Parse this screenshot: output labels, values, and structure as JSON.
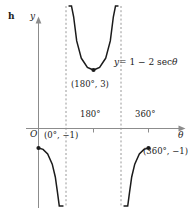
{
  "figure": {
    "part_label": "h"
  },
  "chart_data": {
    "type": "line",
    "title": "",
    "equation_label": "y = 1 − 2 sec θ",
    "equation_parts": {
      "lhs": "y",
      "rhs": "= 1 − 2 sec",
      "variable": "θ"
    },
    "xlabel": "θ",
    "ylabel": "y",
    "origin_label": "O",
    "xlim": [
      -20,
      395
    ],
    "ylim": [
      -11,
      11
    ],
    "grid": false,
    "legend": "none",
    "xticks": [
      180,
      360
    ],
    "xtick_labels": [
      "180°",
      "360°"
    ],
    "yticks": [],
    "ytick_labels": [],
    "asymptotes": [
      {
        "x": 90,
        "style": "dashed"
      },
      {
        "x": 270,
        "style": "dashed"
      }
    ],
    "points": [
      {
        "x": 0,
        "y": -1,
        "label": "(0°, −1)"
      },
      {
        "x": 180,
        "y": 3,
        "label": "(180°, 3)"
      },
      {
        "x": 360,
        "y": -1,
        "label": "(360°, −1)"
      }
    ],
    "series": [
      {
        "name": "y = 1 - 2 sec(theta) branch 1",
        "x_range": [
          0,
          90
        ],
        "values": [
          {
            "x": 0,
            "y": -1
          },
          {
            "x": 15,
            "y": -1.071
          },
          {
            "x": 30,
            "y": -1.309
          },
          {
            "x": 45,
            "y": -1.828
          },
          {
            "x": 55,
            "y": -2.487
          },
          {
            "x": 62,
            "y": -3.26
          },
          {
            "x": 68,
            "y": -4.34
          },
          {
            "x": 72,
            "y": -5.47
          },
          {
            "x": 75,
            "y": -6.73
          },
          {
            "x": 78,
            "y": -8.62
          },
          {
            "x": 80,
            "y": -10.52
          }
        ]
      },
      {
        "name": "y = 1 - 2 sec(theta) branch 2",
        "x_range": [
          90,
          270
        ],
        "values": [
          {
            "x": 100,
            "y": 12.51
          },
          {
            "x": 103,
            "y": 9.88
          },
          {
            "x": 108,
            "y": 7.47
          },
          {
            "x": 115,
            "y": 5.73
          },
          {
            "x": 125,
            "y": 4.49
          },
          {
            "x": 140,
            "y": 3.61
          },
          {
            "x": 160,
            "y": 3.13
          },
          {
            "x": 180,
            "y": 3.0
          },
          {
            "x": 200,
            "y": 3.13
          },
          {
            "x": 220,
            "y": 3.61
          },
          {
            "x": 235,
            "y": 4.49
          },
          {
            "x": 245,
            "y": 5.73
          },
          {
            "x": 252,
            "y": 7.47
          },
          {
            "x": 257,
            "y": 9.88
          },
          {
            "x": 260,
            "y": 12.51
          }
        ]
      },
      {
        "name": "y = 1 - 2 sec(theta) branch 3",
        "x_range": [
          270,
          360
        ],
        "values": [
          {
            "x": 280,
            "y": -10.52
          },
          {
            "x": 282,
            "y": -8.62
          },
          {
            "x": 285,
            "y": -6.73
          },
          {
            "x": 288,
            "y": -5.47
          },
          {
            "x": 292,
            "y": -4.34
          },
          {
            "x": 298,
            "y": -3.26
          },
          {
            "x": 305,
            "y": -2.487
          },
          {
            "x": 315,
            "y": -1.828
          },
          {
            "x": 330,
            "y": -1.309
          },
          {
            "x": 345,
            "y": -1.071
          },
          {
            "x": 360,
            "y": -1
          }
        ]
      }
    ],
    "colors": {
      "curve": "#1b1b1b",
      "axis": "#8c8c8c",
      "asymptote": "#8c8c8c",
      "text": "#1b1b1b",
      "point": "#1b1b1b"
    }
  }
}
